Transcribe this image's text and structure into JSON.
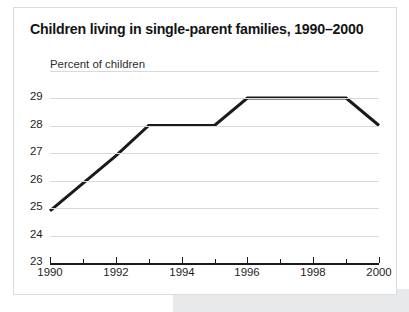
{
  "card": {
    "title": "Children living in single-parent families, 1990–2000"
  },
  "chart_data": {
    "type": "line",
    "title": "Children living in single-parent families, 1990–2000",
    "subtitle": "",
    "xlabel": "",
    "ylabel": "Percent of children",
    "x": [
      1990,
      1991,
      1992,
      1993,
      1994,
      1995,
      1996,
      1997,
      1998,
      1999,
      2000
    ],
    "values": [
      24.9,
      25.9,
      26.9,
      28.0,
      28.0,
      28.0,
      29.0,
      29.0,
      29.0,
      29.0,
      28.0
    ],
    "series": [
      {
        "name": "Percent of children",
        "values": [
          24.9,
          25.9,
          26.9,
          28.0,
          28.0,
          28.0,
          29.0,
          29.0,
          29.0,
          29.0,
          28.0
        ]
      }
    ],
    "xlim": [
      1990,
      2000
    ],
    "ylim": [
      23,
      29.6
    ],
    "ytick_labels": [
      "29",
      "28",
      "27",
      "26",
      "25",
      "24",
      "23"
    ],
    "ytick_values": [
      29,
      28,
      27,
      26,
      25,
      24,
      23
    ],
    "xtick_values": [
      1990,
      1991,
      1992,
      1993,
      1994,
      1995,
      1996,
      1997,
      1998,
      1999,
      2000
    ],
    "xtick_labels": [
      "1990",
      "",
      "1992",
      "",
      "1994",
      "",
      "1996",
      "",
      "1998",
      "",
      "2000"
    ],
    "xtick_labels_shown": [
      "1990",
      "1992",
      "1994",
      "1996",
      "1998",
      "2000"
    ],
    "grid": true,
    "grid_axis": "y",
    "legend": false,
    "legend_position": "none",
    "line_color": "#1a1a1a",
    "line_width": 3,
    "grid_color": "#d9d9d9",
    "axis_color": "#1a1a1a",
    "background_color": "#ffffff",
    "annotations": []
  }
}
